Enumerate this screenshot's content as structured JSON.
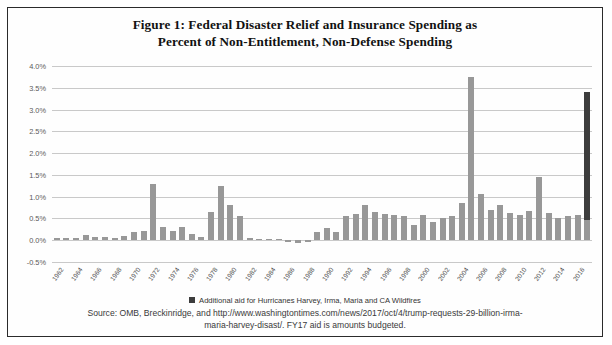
{
  "figure": {
    "title_line_1": "Figure 1: Federal Disaster Relief and Insurance Spending as",
    "title_line_2": "Percent of Non-Entitlement, Non-Defense Spending",
    "legend_label": "Additional aid for Hurricanes Harvey, Irma, Maria and CA Wildfires",
    "source_line_1": "Source: OMB, Breckinridge, and http://www.washingtontimes.com/news/2017/oct/4/trump-requests-29-billion-irma-",
    "source_line_2": "maria-harvey-disast/. FY17 aid is amounts budgeted.",
    "colors": {
      "bar": "#989898",
      "additional_aid": "#3d3d3d",
      "gridline": "#c9c9c9",
      "border": "#2b2b2b"
    }
  },
  "chart_data": {
    "type": "bar",
    "title": "Figure 1: Federal Disaster Relief and Insurance Spending as Percent of Non-Entitlement, Non-Defense Spending",
    "xlabel": "",
    "ylabel": "",
    "ylim": [
      -0.5,
      4.0
    ],
    "ytick_labels": [
      "4.0%",
      "3.5%",
      "3.0%",
      "2.5%",
      "2.0%",
      "1.5%",
      "1.0%",
      "0.5%",
      "0.0%",
      "-0.5%"
    ],
    "ytick_values": [
      4.0,
      3.5,
      3.0,
      2.5,
      2.0,
      1.5,
      1.0,
      0.5,
      0.0,
      -0.5
    ],
    "grid": true,
    "legend_position": "bottom",
    "units": "percent",
    "xtick_labels": [
      "1962",
      "1964",
      "1966",
      "1968",
      "1970",
      "1972",
      "1974",
      "1976",
      "1978",
      "1980",
      "1982",
      "1984",
      "1986",
      "1988",
      "1990",
      "1992",
      "1994",
      "1996",
      "1998",
      "2000",
      "2002",
      "2004",
      "2006",
      "2008",
      "2010",
      "2012",
      "2014",
      "2016"
    ],
    "xtick_step": 2,
    "categories": [
      1962,
      1963,
      1964,
      1965,
      1966,
      1967,
      1968,
      1969,
      1970,
      1971,
      1972,
      1973,
      1974,
      1975,
      1976,
      1977,
      1978,
      1979,
      1980,
      1981,
      1982,
      1983,
      1984,
      1985,
      1986,
      1987,
      1988,
      1989,
      1990,
      1991,
      1992,
      1993,
      1994,
      1995,
      1996,
      1997,
      1998,
      1999,
      2000,
      2001,
      2002,
      2003,
      2004,
      2005,
      2006,
      2007,
      2008,
      2009,
      2010,
      2011,
      2012,
      2013,
      2014,
      2015,
      2016,
      2017
    ],
    "series": [
      {
        "name": "Federal disaster relief and insurance spending",
        "color": "#989898",
        "values": [
          0.05,
          0.05,
          0.06,
          0.12,
          0.08,
          0.07,
          0.05,
          0.1,
          0.2,
          0.22,
          1.3,
          0.3,
          0.22,
          0.3,
          0.15,
          0.07,
          0.65,
          1.25,
          0.8,
          0.55,
          0.05,
          0.02,
          0.02,
          0.03,
          -0.05,
          -0.06,
          -0.05,
          0.2,
          0.28,
          0.18,
          0.55,
          0.6,
          0.8,
          0.65,
          0.6,
          0.58,
          0.55,
          0.35,
          0.58,
          0.42,
          0.5,
          0.55,
          0.85,
          3.75,
          1.05,
          0.7,
          0.8,
          0.62,
          0.58,
          0.67,
          1.45,
          0.62,
          0.52,
          0.55,
          0.58,
          0.47
        ]
      },
      {
        "name": "Additional aid for Hurricanes Harvey, Irma, Maria and CA Wildfires",
        "color": "#3d3d3d",
        "values": [
          0,
          0,
          0,
          0,
          0,
          0,
          0,
          0,
          0,
          0,
          0,
          0,
          0,
          0,
          0,
          0,
          0,
          0,
          0,
          0,
          0,
          0,
          0,
          0,
          0,
          0,
          0,
          0,
          0,
          0,
          0,
          0,
          0,
          0,
          0,
          0,
          0,
          0,
          0,
          0,
          0,
          0,
          0,
          0,
          0,
          0,
          0,
          0,
          0,
          0,
          0,
          0,
          0,
          0,
          0,
          2.93
        ]
      }
    ],
    "notable_points": [
      {
        "year": 1972,
        "value": 1.3
      },
      {
        "year": 1979,
        "value": 1.25
      },
      {
        "year": 2005,
        "value": 3.75
      },
      {
        "year": 2012,
        "value": 1.45
      },
      {
        "year": 2017,
        "value": 3.4
      }
    ]
  }
}
